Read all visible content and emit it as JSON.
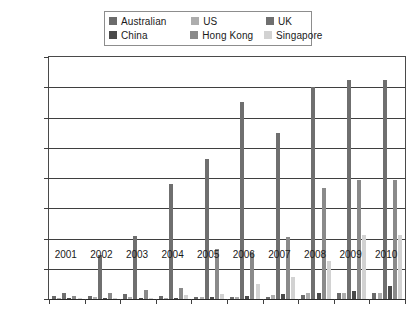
{
  "legend": {
    "position": "top-center",
    "rows": [
      [
        {
          "label": "Australian",
          "color": "#6b6b6b"
        },
        {
          "label": "US",
          "color": "#adadad"
        },
        {
          "label": "UK",
          "color": "#6f6f6f"
        }
      ],
      [
        {
          "label": "China",
          "color": "#4a4a4a"
        },
        {
          "label": "Hong Kong",
          "color": "#8a8a8a"
        },
        {
          "label": "Singapore",
          "color": "#d2d2d2"
        }
      ]
    ]
  },
  "axes": {
    "y_ticks": [
      "0",
      "2000",
      "4000",
      "6000",
      "8000",
      "10000",
      "12000",
      "14000",
      "16000"
    ],
    "x_ticks": [
      "2001",
      "2002",
      "2003",
      "2004",
      "2005",
      "2006",
      "2007",
      "2008",
      "2009",
      "2010"
    ]
  },
  "chart_data": {
    "type": "bar",
    "title": "",
    "xlabel": "",
    "ylabel": "",
    "ylim": [
      0,
      16000
    ],
    "ytick_step": 2000,
    "grid": true,
    "legend_position": "top-center",
    "categories": [
      "2001",
      "2002",
      "2003",
      "2004",
      "2005",
      "2006",
      "2007",
      "2008",
      "2009",
      "2010"
    ],
    "series": [
      {
        "name": "Australian",
        "color": "#6b6b6b",
        "values": [
          180,
          180,
          330,
          200,
          150,
          130,
          120,
          260,
          430,
          400
        ]
      },
      {
        "name": "US",
        "color": "#adadad",
        "values": [
          60,
          130,
          120,
          60,
          110,
          150,
          240,
          380,
          420,
          410
        ]
      },
      {
        "name": "UK",
        "color": "#6f6f6f",
        "values": [
          420,
          2900,
          4150,
          7600,
          9250,
          13000,
          10950,
          14000,
          14500,
          14500
        ]
      },
      {
        "name": "China",
        "color": "#4a4a4a",
        "values": [
          60,
          60,
          60,
          80,
          160,
          230,
          330,
          430,
          520,
          830
        ]
      },
      {
        "name": "Hong Kong",
        "color": "#8a8a8a",
        "values": [
          230,
          430,
          570,
          720,
          3300,
          3100,
          4100,
          7350,
          7900,
          7900
        ]
      },
      {
        "name": "Singapore",
        "color": "#d2d2d2",
        "values": [
          60,
          60,
          90,
          280,
          320,
          1000,
          1450,
          2500,
          4200,
          4200
        ]
      }
    ]
  }
}
